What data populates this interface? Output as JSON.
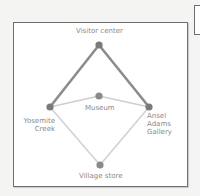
{
  "diagram": {
    "nodes": [
      {
        "id": "visitor_center",
        "label": "Visitor center",
        "x": 99,
        "y": 45
      },
      {
        "id": "museum",
        "label": "Museum",
        "x": 99,
        "y": 96
      },
      {
        "id": "yosemite_creek",
        "label": "Yosemite Creek",
        "label_lines": [
          "Yosemite",
          "Creek"
        ],
        "x": 50,
        "y": 107
      },
      {
        "id": "ansel_adams_gallery",
        "label": "Ansel Adams Gallery",
        "label_lines": [
          "Ansel",
          "Adams",
          "Gallery"
        ],
        "x": 149,
        "y": 107
      },
      {
        "id": "village_store",
        "label": "Village store",
        "x": 100,
        "y": 165
      }
    ],
    "edges": [
      {
        "from": "yosemite_creek",
        "to": "visitor_center",
        "style": "bold"
      },
      {
        "from": "visitor_center",
        "to": "ansel_adams_gallery",
        "style": "bold"
      },
      {
        "from": "yosemite_creek",
        "to": "museum",
        "style": "light"
      },
      {
        "from": "museum",
        "to": "ansel_adams_gallery",
        "style": "light"
      },
      {
        "from": "yosemite_creek",
        "to": "village_store",
        "style": "light"
      },
      {
        "from": "village_store",
        "to": "ansel_adams_gallery",
        "style": "light"
      }
    ],
    "colors": {
      "bold_edge": "#8c8c8c",
      "light_edge": "#cfcfcf",
      "node": "#7a7a7a",
      "label": "#8a8a8a",
      "frame": "#6e6e6e"
    }
  },
  "labels": {
    "visitor_center": "Visitor center",
    "museum": "Museum",
    "yosemite_1": "Yosemite",
    "yosemite_2": "Creek",
    "ansel_1": "Ansel",
    "ansel_2": "Adams",
    "ansel_3": "Gallery",
    "village_store": "Village store"
  }
}
